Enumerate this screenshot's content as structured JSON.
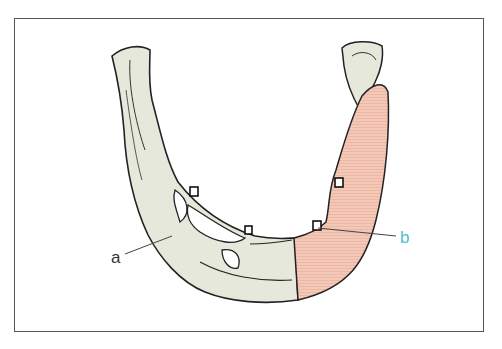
{
  "figure": {
    "labels": {
      "a": "a",
      "b": "b"
    },
    "parts": [
      {
        "id": "native-mandible",
        "color": "#e6e8dc"
      },
      {
        "id": "bone-graft",
        "color": "#f2c6b4"
      },
      {
        "id": "implants",
        "count": 4
      }
    ],
    "colors": {
      "outline": "#222222",
      "frame": "#555555",
      "label_a": "#333333",
      "label_b": "#4fc3c8"
    }
  }
}
